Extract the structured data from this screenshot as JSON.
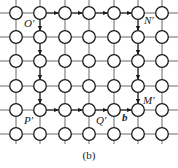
{
  "diagram": {
    "caption": "(b)",
    "grid": {
      "columns_x": [
        16,
        40,
        65,
        89,
        114,
        138,
        162
      ],
      "rows_y": [
        13,
        37,
        61,
        86,
        110,
        134
      ],
      "node_radius": 6.3,
      "line_color": "#6a6a6a",
      "node_stroke": "#1a1a1a"
    },
    "labels": [
      {
        "id": "O-prime",
        "text": "O′",
        "x": 24,
        "y": 27,
        "bold": false
      },
      {
        "id": "N-prime",
        "text": "N′",
        "x": 144,
        "y": 24,
        "bold": false
      },
      {
        "id": "P-prime",
        "text": "P′",
        "x": 24,
        "y": 124,
        "bold": false
      },
      {
        "id": "Q-prime",
        "text": "Q′",
        "x": 96,
        "y": 124,
        "bold": false
      },
      {
        "id": "b-vector",
        "text": "b",
        "x": 122,
        "y": 121,
        "bold": true
      },
      {
        "id": "M-prime",
        "text": "M′",
        "x": 143,
        "y": 104,
        "bold": false
      }
    ],
    "paths": [
      {
        "name": "O-to-N",
        "direction": "right",
        "row": 0,
        "from_col": 1,
        "to_col": 5
      },
      {
        "name": "N-to-M",
        "direction": "down",
        "col": 5,
        "from_row": 0,
        "to_row": 4
      },
      {
        "name": "O-to-P",
        "direction": "down",
        "col": 1,
        "from_row": 0,
        "to_row": 4
      },
      {
        "name": "P-to-M",
        "direction": "right",
        "row": 4,
        "from_col": 1,
        "to_col": 5
      }
    ]
  }
}
